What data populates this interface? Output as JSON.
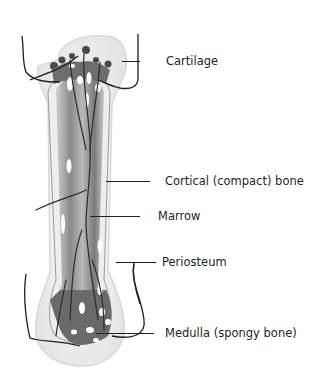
{
  "diagram": {
    "subject": "bone",
    "colors": {
      "line": "#231f20",
      "cortical": "#e6e6e6",
      "marrow_dark": "#6d6d6d",
      "marrow_mid": "#a8a8a8",
      "periosteum": "#f1f1f1",
      "background": "#ffffff"
    },
    "labels": [
      {
        "id": "cartilage",
        "text": "Cartilage"
      },
      {
        "id": "cortical",
        "text": "Cortical (compact) bone"
      },
      {
        "id": "marrow",
        "text": "Marrow"
      },
      {
        "id": "periosteum",
        "text": "Periosteum"
      },
      {
        "id": "medulla",
        "text": "Medulla (spongy bone)"
      }
    ]
  }
}
